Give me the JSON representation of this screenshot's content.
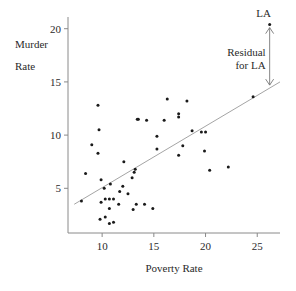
{
  "chart_data": {
    "type": "scatter",
    "title": "",
    "xlabel": "Poverty Rate",
    "ylabel_lines": [
      "Murder",
      "Rate"
    ],
    "xlim": [
      6.7,
      27.2
    ],
    "ylim": [
      0.8,
      21.1
    ],
    "x_ticks": [
      10,
      15,
      20,
      25
    ],
    "y_ticks": [
      5,
      10,
      15,
      20
    ],
    "x_tick_labels": [
      "10",
      "15",
      "20",
      "25"
    ],
    "y_tick_labels": [
      "5",
      "10",
      "15",
      "20"
    ],
    "grid": false,
    "legend": null,
    "points": [
      {
        "x": 26.2,
        "y": 20.4,
        "label": "LA"
      },
      {
        "x": 24.6,
        "y": 13.6
      },
      {
        "x": 16.3,
        "y": 13.4
      },
      {
        "x": 18.2,
        "y": 13.2
      },
      {
        "x": 9.6,
        "y": 12.8
      },
      {
        "x": 17.4,
        "y": 12.0
      },
      {
        "x": 17.4,
        "y": 11.7
      },
      {
        "x": 13.4,
        "y": 11.5
      },
      {
        "x": 13.5,
        "y": 11.5
      },
      {
        "x": 14.3,
        "y": 11.4
      },
      {
        "x": 16.0,
        "y": 11.4
      },
      {
        "x": 9.7,
        "y": 10.5
      },
      {
        "x": 18.7,
        "y": 10.4
      },
      {
        "x": 19.6,
        "y": 10.3
      },
      {
        "x": 20.0,
        "y": 10.3
      },
      {
        "x": 15.3,
        "y": 9.9
      },
      {
        "x": 9.0,
        "y": 9.1
      },
      {
        "x": 17.8,
        "y": 9.0
      },
      {
        "x": 15.3,
        "y": 8.7
      },
      {
        "x": 19.9,
        "y": 8.5
      },
      {
        "x": 9.6,
        "y": 8.3
      },
      {
        "x": 17.4,
        "y": 8.1
      },
      {
        "x": 12.1,
        "y": 7.5
      },
      {
        "x": 13.2,
        "y": 6.8
      },
      {
        "x": 20.4,
        "y": 6.7
      },
      {
        "x": 22.2,
        "y": 7.0
      },
      {
        "x": 13.1,
        "y": 6.5
      },
      {
        "x": 8.4,
        "y": 6.4
      },
      {
        "x": 12.9,
        "y": 6.0
      },
      {
        "x": 9.9,
        "y": 5.8
      },
      {
        "x": 12.0,
        "y": 5.2
      },
      {
        "x": 10.8,
        "y": 5.4
      },
      {
        "x": 10.2,
        "y": 5.0
      },
      {
        "x": 11.7,
        "y": 4.7
      },
      {
        "x": 12.5,
        "y": 4.5
      },
      {
        "x": 8.0,
        "y": 3.8
      },
      {
        "x": 9.9,
        "y": 3.7
      },
      {
        "x": 10.3,
        "y": 4.0
      },
      {
        "x": 10.7,
        "y": 4.0
      },
      {
        "x": 11.1,
        "y": 4.0
      },
      {
        "x": 10.7,
        "y": 3.1
      },
      {
        "x": 11.6,
        "y": 3.5
      },
      {
        "x": 13.3,
        "y": 3.5
      },
      {
        "x": 14.1,
        "y": 3.5
      },
      {
        "x": 14.9,
        "y": 3.1
      },
      {
        "x": 13.0,
        "y": 3.0
      },
      {
        "x": 10.3,
        "y": 2.3
      },
      {
        "x": 9.8,
        "y": 2.1
      },
      {
        "x": 10.7,
        "y": 1.7
      },
      {
        "x": 11.1,
        "y": 1.8
      }
    ],
    "regression_line": {
      "x1": 7.3,
      "y1": 3.5,
      "x2": 27.2,
      "y2": 15.0
    },
    "annotations": {
      "point_label": "LA",
      "residual_label_lines": [
        "Residual",
        "for LA"
      ],
      "residual_arrow": {
        "x": 26.2,
        "y_from": 20.1,
        "y_to": 14.7
      }
    }
  },
  "colors": {
    "axis": "#8a8a8a",
    "point": "#1a1a1a",
    "line": "#9a9a9a",
    "text": "#2a2a2a"
  }
}
